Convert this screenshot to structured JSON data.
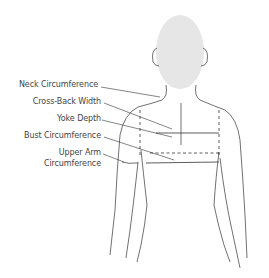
{
  "diagram": {
    "labels": [
      {
        "id": "neck",
        "text": "Neck Circumference"
      },
      {
        "id": "cross_back",
        "text": "Cross-Back Width"
      },
      {
        "id": "yoke",
        "text": "Yoke Depth"
      },
      {
        "id": "bust",
        "text": "Bust Circumference"
      },
      {
        "id": "upper_arm_1",
        "text": "Upper Arm"
      },
      {
        "id": "upper_arm_2",
        "text": "Circumference"
      }
    ],
    "colors": {
      "line": "#333333",
      "head": "#e6e6e6",
      "text": "#444444"
    }
  }
}
